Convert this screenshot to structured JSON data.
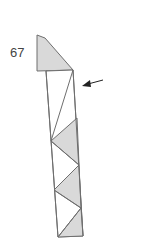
{
  "step": {
    "number": "67"
  },
  "colors": {
    "line": "#6e6e6e",
    "fill": "#d9d9d9",
    "arrow": "#222222",
    "background": "#ffffff"
  },
  "diagram": {
    "type": "origami-step",
    "flap": [
      [
        37,
        35
      ],
      [
        45,
        38
      ],
      [
        73,
        70
      ],
      [
        37,
        71
      ]
    ],
    "strip_outline": [
      [
        46,
        71
      ],
      [
        73,
        70
      ],
      [
        83,
        236
      ],
      [
        58,
        237
      ]
    ],
    "fold_lines": [
      [
        [
          73,
          70
        ],
        [
          51,
          141
        ]
      ],
      [
        [
          51,
          141
        ],
        [
          79,
          165
        ]
      ],
      [
        [
          79,
          165
        ],
        [
          54,
          190
        ]
      ],
      [
        [
          54,
          190
        ],
        [
          81,
          208
        ]
      ],
      [
        [
          81,
          208
        ],
        [
          58,
          237
        ]
      ]
    ],
    "shaded_triangles": [
      [
        [
          77,
          118
        ],
        [
          51,
          141
        ],
        [
          79,
          165
        ]
      ],
      [
        [
          79,
          165
        ],
        [
          54,
          190
        ],
        [
          81,
          208
        ]
      ],
      [
        [
          81,
          208
        ],
        [
          58,
          237
        ],
        [
          83,
          236
        ]
      ]
    ],
    "arrow": {
      "from": [
        103,
        80
      ],
      "to": [
        83,
        85
      ]
    }
  }
}
